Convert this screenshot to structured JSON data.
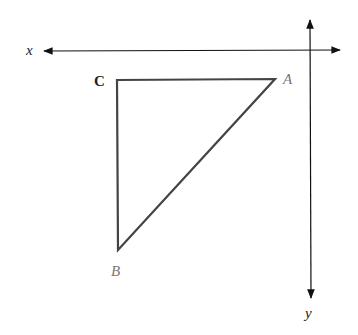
{
  "diagram": {
    "axes": {
      "x_label": "x",
      "y_label": "y"
    },
    "triangle": {
      "vertices": [
        {
          "name": "C",
          "label": "C"
        },
        {
          "name": "A",
          "label": "A"
        },
        {
          "name": "B",
          "label": "B"
        }
      ]
    },
    "colors": {
      "stroke": "#444444",
      "axis": "#111111",
      "label_dark": "#222222",
      "label_light": "#777777"
    }
  }
}
